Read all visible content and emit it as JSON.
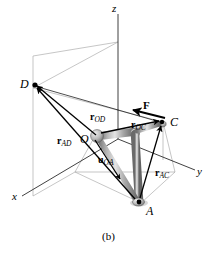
{
  "figure": {
    "caption": "(b)",
    "axes": [
      {
        "name": "z",
        "label": "z"
      },
      {
        "name": "x",
        "label": "x"
      },
      {
        "name": "y",
        "label": "y"
      }
    ],
    "points": [
      {
        "name": "O",
        "label": "O"
      },
      {
        "name": "A",
        "label": "A"
      },
      {
        "name": "C",
        "label": "C"
      },
      {
        "name": "D",
        "label": "D"
      }
    ],
    "vectors": [
      {
        "name": "r-OD",
        "symbol": "r",
        "subscript": "OD"
      },
      {
        "name": "r-OC",
        "symbol": "r",
        "subscript": "OC"
      },
      {
        "name": "r-AD",
        "symbol": "r",
        "subscript": "AD"
      },
      {
        "name": "r-AC",
        "symbol": "r",
        "subscript": "AC"
      },
      {
        "name": "u-OA",
        "symbol": "u",
        "subscript": "OA"
      }
    ],
    "force": {
      "name": "F",
      "label": "F"
    },
    "colors": {
      "ink": "#000000",
      "construction_line": "#9a9a9a",
      "pipe_light": "#d8d8d8",
      "pipe_mid": "#a8a8a8",
      "pipe_dark": "#6e6e6e",
      "background": "#ffffff"
    }
  }
}
